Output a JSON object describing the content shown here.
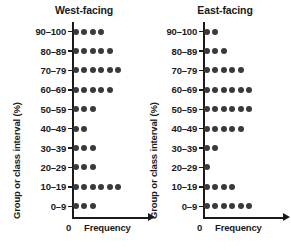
{
  "chart_data": {
    "type": "dotplot",
    "title": "",
    "xlabel": "Frequency",
    "ylabel": "Group or class interval (%)",
    "x_origin_label": "0",
    "categories": [
      "90–100",
      "80–89",
      "70–79",
      "60–69",
      "50–59",
      "40–49",
      "30–39",
      "20–29",
      "10–19",
      "0–9"
    ],
    "grid": false,
    "legend_position": "none",
    "dot_color": "#3a3a3a",
    "axis_color": "#1a1a1a",
    "series": [
      {
        "name": "West-facing",
        "values": [
          4,
          5,
          6,
          5,
          3,
          2,
          3,
          3,
          6,
          3
        ]
      },
      {
        "name": "East-facing",
        "values": [
          2,
          3,
          5,
          6,
          6,
          5,
          2,
          1,
          4,
          6
        ]
      }
    ]
  },
  "panels": [
    {
      "title": "West-facing",
      "ylabel": "Group or class interval (%)",
      "xlabel": "Frequency",
      "x_origin_label": "0",
      "rows": [
        {
          "label": "90–100",
          "count": 4
        },
        {
          "label": "80–89",
          "count": 5
        },
        {
          "label": "70–79",
          "count": 6
        },
        {
          "label": "60–69",
          "count": 5
        },
        {
          "label": "50–59",
          "count": 3
        },
        {
          "label": "40–49",
          "count": 2
        },
        {
          "label": "30–39",
          "count": 3
        },
        {
          "label": "20–29",
          "count": 3
        },
        {
          "label": "10–19",
          "count": 6
        },
        {
          "label": "0–9",
          "count": 3
        }
      ]
    },
    {
      "title": "East-facing",
      "ylabel": "Group or class interval (%)",
      "xlabel": "Frequency",
      "x_origin_label": "0",
      "rows": [
        {
          "label": "90–100",
          "count": 2
        },
        {
          "label": "80–89",
          "count": 3
        },
        {
          "label": "70–79",
          "count": 5
        },
        {
          "label": "60–69",
          "count": 6
        },
        {
          "label": "50–59",
          "count": 6
        },
        {
          "label": "40–49",
          "count": 5
        },
        {
          "label": "30–39",
          "count": 2
        },
        {
          "label": "20–29",
          "count": 1
        },
        {
          "label": "10–19",
          "count": 4
        },
        {
          "label": "0–9",
          "count": 6
        }
      ]
    }
  ]
}
